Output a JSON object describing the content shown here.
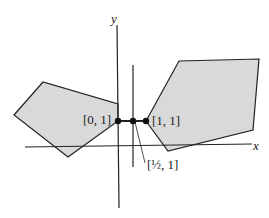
{
  "axes": {
    "x_label": "x",
    "y_label": "y"
  },
  "points": {
    "p0": {
      "label": "[0, 1]"
    },
    "phalf": {
      "label": "[½, 1]"
    },
    "p1": {
      "label": "[1, 1]"
    }
  },
  "colors": {
    "fill": "#d9d9d9",
    "stroke": "#222222"
  }
}
